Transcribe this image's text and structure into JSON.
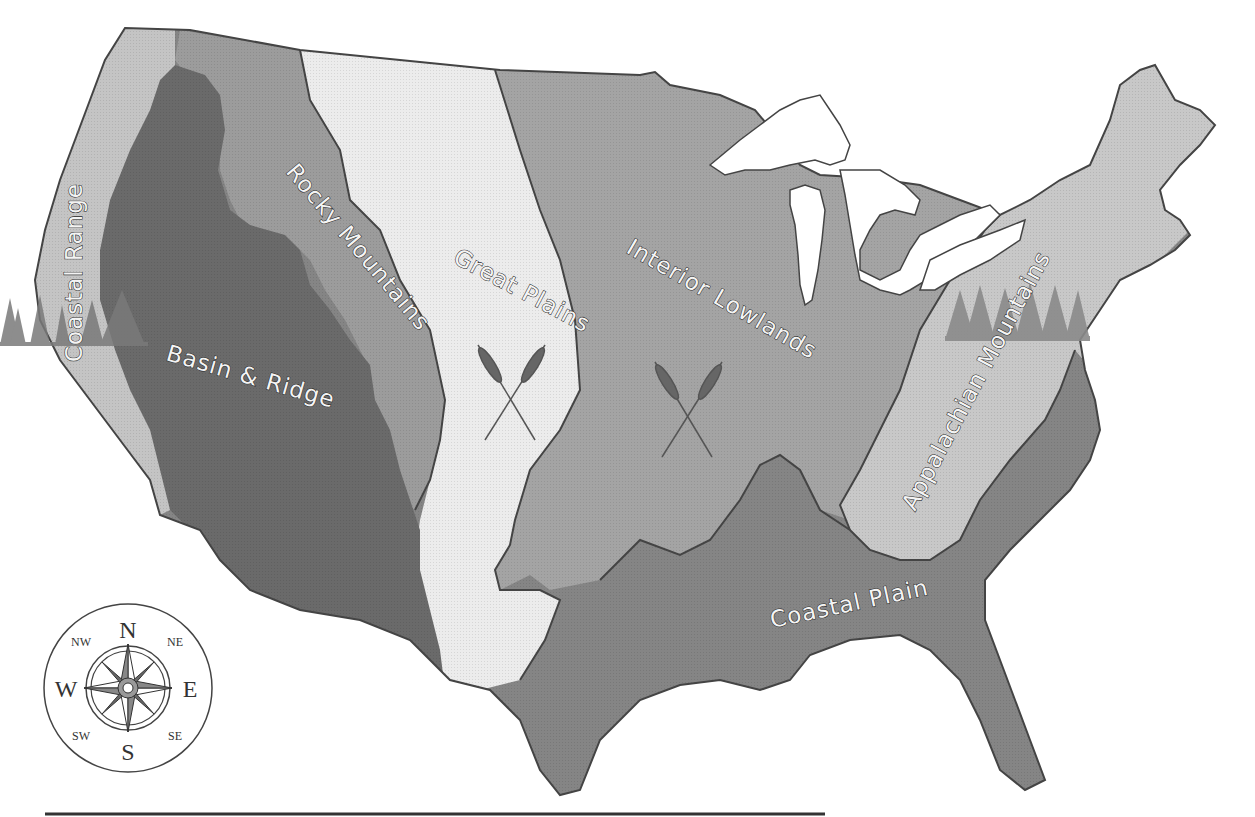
{
  "map": {
    "title": "Landform regions of the contiguous United States",
    "regions": [
      {
        "id": "coastal-range",
        "label": "Coastal Range",
        "shade": "#c4c4c4"
      },
      {
        "id": "basin-ridge",
        "label": "Basin & Ridge",
        "shade": "#6a6a6a"
      },
      {
        "id": "rocky-mountains",
        "label": "Rocky Mountains",
        "shade": "#9c9c9c"
      },
      {
        "id": "great-plains",
        "label": "Great Plains",
        "shade": "#ececec"
      },
      {
        "id": "interior-lowlands",
        "label": "Interior Lowlands",
        "shade": "#a4a4a4"
      },
      {
        "id": "appalachian-mountains",
        "label": "Appalachian Mountains",
        "shade": "#c8c8c8"
      },
      {
        "id": "coastal-plain",
        "label": "Coastal Plain",
        "shade": "#858585"
      }
    ],
    "water_color": "#ffffff",
    "icons": [
      "tree-icon",
      "wheat-icon",
      "compass-rose-icon"
    ]
  },
  "compass": {
    "n": "N",
    "s": "S",
    "e": "E",
    "w": "W",
    "ne": "NE",
    "nw": "NW",
    "se": "SE",
    "sw": "SW"
  },
  "answer_line": {
    "value": ""
  }
}
